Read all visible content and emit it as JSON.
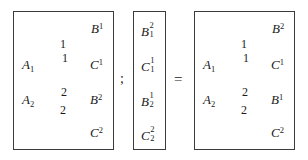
{
  "figure": {
    "type": "commutative-diagram-equation",
    "separators": {
      "semicolon": ";",
      "equals": "="
    }
  },
  "panels": [
    {
      "id": "left",
      "kind": "arrow-diagram",
      "nodes": {
        "a1": {
          "base": "A",
          "sub": "1"
        },
        "b1": {
          "base": "B",
          "sup": "1"
        },
        "c1": {
          "base": "C",
          "sup": "1"
        },
        "a2": {
          "base": "A",
          "sub": "2"
        },
        "b2": {
          "base": "B",
          "sup": "2"
        },
        "c2": {
          "base": "C",
          "sup": "2"
        }
      },
      "edges": [
        {
          "from": "a1",
          "to": "b1",
          "label": "1"
        },
        {
          "from": "a1",
          "to": "c1",
          "label": "1"
        },
        {
          "from": "a2",
          "to": "b2",
          "label": "2"
        },
        {
          "from": "a2",
          "to": "c2",
          "label": "2"
        }
      ]
    },
    {
      "id": "middle",
      "kind": "symbol-column",
      "entries": [
        {
          "base": "B",
          "sub": "1",
          "sup": "2"
        },
        {
          "base": "C",
          "sub": "1",
          "sup": "1"
        },
        {
          "base": "B",
          "sub": "2",
          "sup": "1"
        },
        {
          "base": "C",
          "sub": "2",
          "sup": "2"
        }
      ]
    },
    {
      "id": "right",
      "kind": "arrow-diagram",
      "nodes": {
        "a1": {
          "base": "A",
          "sub": "1"
        },
        "b2": {
          "base": "B",
          "sup": "2"
        },
        "c1": {
          "base": "C",
          "sup": "1"
        },
        "a2": {
          "base": "A",
          "sub": "2"
        },
        "b1": {
          "base": "B",
          "sup": "1"
        },
        "c2": {
          "base": "C",
          "sup": "2"
        }
      },
      "edges": [
        {
          "from": "a1",
          "to": "b2",
          "label": "1"
        },
        {
          "from": "a1",
          "to": "c1",
          "label": "1"
        },
        {
          "from": "a2",
          "to": "b1",
          "label": "2"
        },
        {
          "from": "a2",
          "to": "c2",
          "label": "2"
        }
      ]
    }
  ],
  "labels": {
    "left": {
      "a1_base": "A",
      "a1_sub": "1",
      "b1_base": "B",
      "b1_sup": "1",
      "c1_base": "C",
      "c1_sup": "1",
      "a2_base": "A",
      "a2_sub": "2",
      "b2_base": "B",
      "b2_sup": "2",
      "c2_base": "C",
      "c2_sup": "2",
      "edge_a1b1": "1",
      "edge_a1c1": "1",
      "edge_a2b2": "2",
      "edge_a2c2": "2"
    },
    "middle": {
      "e1_base": "B",
      "e1_sub": "1",
      "e1_sup": "2",
      "e2_base": "C",
      "e2_sub": "1",
      "e2_sup": "1",
      "e3_base": "B",
      "e3_sub": "2",
      "e3_sup": "1",
      "e4_base": "C",
      "e4_sub": "2",
      "e4_sup": "2"
    },
    "right": {
      "a1_base": "A",
      "a1_sub": "1",
      "b2_base": "B",
      "b2_sup": "2",
      "c1_base": "C",
      "c1_sup": "1",
      "a2_base": "A",
      "a2_sub": "2",
      "b1_base": "B",
      "b1_sup": "1",
      "c2_base": "C",
      "c2_sup": "2",
      "edge_a1b2": "1",
      "edge_a1c1": "1",
      "edge_a2b1": "2",
      "edge_a2c2": "2"
    }
  },
  "colors": {
    "ink": "#1a1a1a",
    "border": "#3b3b3b",
    "background": "#ffffff"
  }
}
